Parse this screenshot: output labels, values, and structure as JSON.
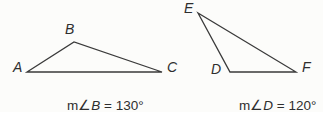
{
  "colors": {
    "background": "#fcfcfa",
    "line": "#3a3a3a",
    "text": "#2e2e2e"
  },
  "left_triangle": {
    "name": "triangle ABC",
    "vertex_labels": [
      "A",
      "B",
      "C"
    ],
    "angle_prefix": "m∠",
    "angle_vertex": "B",
    "angle_value": " = 130°"
  },
  "right_triangle": {
    "name": "triangle DEF",
    "vertex_labels": [
      "D",
      "E",
      "F"
    ],
    "angle_prefix": "m∠",
    "angle_vertex": "D",
    "angle_value": " = 120°"
  }
}
